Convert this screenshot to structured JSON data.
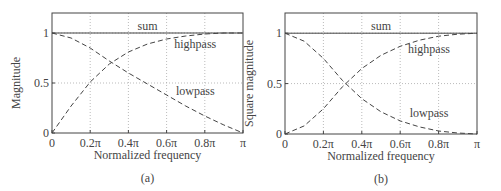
{
  "chart_data": [
    {
      "type": "line",
      "panel": "(a)",
      "title": "",
      "xlabel": "Normalized frequency",
      "ylabel": "Magnitude",
      "caption": "(a)",
      "x_tick_labels": [
        "0",
        "0.2π",
        "0.4π",
        "0.6π",
        "0.8π",
        "π"
      ],
      "y_tick_labels": [
        "0",
        "0.5",
        "1"
      ],
      "x": [
        0,
        0.1,
        0.2,
        0.3,
        0.4,
        0.5,
        0.6,
        0.7,
        0.8,
        0.9,
        1.0
      ],
      "xlim": [
        0,
        1
      ],
      "ylim": [
        0,
        1.2
      ],
      "grid": true,
      "series": [
        {
          "name": "sum",
          "style": "solid",
          "values": [
            1,
            1,
            1,
            1,
            1,
            1,
            1,
            1,
            1,
            1,
            1
          ]
        },
        {
          "name": "highpass",
          "style": "dashed",
          "values": [
            0,
            0.27,
            0.51,
            0.69,
            0.81,
            0.89,
            0.94,
            0.97,
            0.99,
            1.0,
            1.0
          ]
        },
        {
          "name": "lowpass",
          "style": "dashed",
          "values": [
            1,
            0.95,
            0.85,
            0.72,
            0.6,
            0.49,
            0.38,
            0.27,
            0.17,
            0.08,
            0
          ]
        }
      ],
      "annotations": [
        {
          "text": "sum",
          "x": 0.5,
          "y": 1.03
        },
        {
          "text": "highpass",
          "x": 0.75,
          "y": 0.85
        },
        {
          "text": "lowpass",
          "x": 0.75,
          "y": 0.38
        }
      ]
    },
    {
      "type": "line",
      "panel": "(b)",
      "title": "",
      "xlabel": "Normalized frequency",
      "ylabel": "Square magnitude",
      "caption": "(b)",
      "x_tick_labels": [
        "0",
        "0.2π",
        "0.4π",
        "0.6π",
        "0.8π",
        "π"
      ],
      "y_tick_labels": [
        "0",
        "0.5",
        "1"
      ],
      "x": [
        0,
        0.1,
        0.2,
        0.3,
        0.4,
        0.5,
        0.6,
        0.7,
        0.8,
        0.9,
        1.0
      ],
      "xlim": [
        0,
        1
      ],
      "ylim": [
        0,
        1.2
      ],
      "grid": true,
      "series": [
        {
          "name": "sum",
          "style": "solid",
          "values": [
            1,
            1,
            1,
            1,
            1,
            1,
            1,
            1,
            1,
            1,
            1
          ]
        },
        {
          "name": "highpass",
          "style": "dashed",
          "values": [
            0,
            0.08,
            0.25,
            0.47,
            0.65,
            0.78,
            0.87,
            0.93,
            0.97,
            0.99,
            1.0
          ]
        },
        {
          "name": "lowpass",
          "style": "dashed",
          "values": [
            1,
            0.92,
            0.75,
            0.53,
            0.35,
            0.22,
            0.13,
            0.07,
            0.03,
            0.01,
            0
          ]
        }
      ],
      "annotations": [
        {
          "text": "sum",
          "x": 0.5,
          "y": 1.03
        },
        {
          "text": "highpass",
          "x": 0.75,
          "y": 0.8
        },
        {
          "text": "lowpass",
          "x": 0.75,
          "y": 0.17
        }
      ]
    }
  ]
}
